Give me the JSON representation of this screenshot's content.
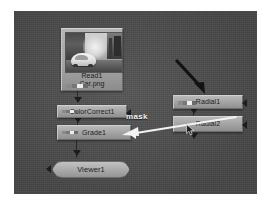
{
  "app": {
    "title": "Node Graph",
    "canvas_background": "#4e4e4e"
  },
  "nodes": [
    {
      "id": "read1",
      "name": "Read1",
      "file": "Car.png",
      "label": "Read1\nCar.png",
      "type": "Read",
      "has_thumbnail": true,
      "thumbnail_description": "grayscale photo of a light-colored car on a street"
    },
    {
      "id": "colorcorrect1",
      "name": "ColorCorrect1",
      "label": "ColorCorrect1",
      "type": "ColorCorrect"
    },
    {
      "id": "grade1",
      "name": "Grade1",
      "label": "Grade1",
      "type": "Grade"
    },
    {
      "id": "viewer1",
      "name": "Viewer1",
      "label": "Viewer1",
      "type": "Viewer"
    },
    {
      "id": "radial1",
      "name": "Radial1",
      "label": "Radial1",
      "type": "Radial"
    },
    {
      "id": "radial2",
      "name": "Radial2",
      "label": "Radial2",
      "type": "Radial"
    }
  ],
  "annotations": {
    "mask_label": "mask",
    "mask_arrow_color": "#f2f2f2",
    "mask_arrow_from": "Radial2",
    "mask_arrow_to": "Grade1",
    "pointer_arrow_color": "#141414",
    "pointer_arrow_target": "Radial1"
  },
  "connections": [
    {
      "from": "Read1",
      "to": "ColorCorrect1"
    },
    {
      "from": "ColorCorrect1",
      "to": "Grade1"
    },
    {
      "from": "Grade1",
      "to": "Viewer1"
    },
    {
      "from": "Radial1",
      "to": "Radial2"
    }
  ],
  "colors": {
    "canvas": "#4e4e4e",
    "node_fill": "#a6a6a6",
    "node_border": "#6d6d6d",
    "node_text": "#1c1c1c",
    "pipe": "#1d1d1d",
    "annotation_white": "#f2f2f2",
    "page_background": "#ffffff"
  },
  "icons": {
    "mouse_cursor": "cursor-arrow-icon",
    "channel_strip": "rgba-channel-strip-icon"
  }
}
